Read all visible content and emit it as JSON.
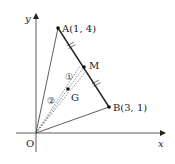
{
  "diagram": {
    "type": "coordinate-geometry",
    "axes": {
      "x_label": "x",
      "y_label": "y",
      "origin_label": "O"
    },
    "points": {
      "A": {
        "label": "A(1,  4)",
        "coords": [
          1,
          4
        ]
      },
      "B": {
        "label": "B(3,  1)",
        "coords": [
          3,
          1
        ]
      },
      "M": {
        "label": "M",
        "description": "midpoint of AB"
      },
      "G": {
        "label": "G",
        "description": "centroid of triangle OAB"
      }
    },
    "segment_labels": {
      "GM": "①",
      "OG": "②"
    },
    "colors": {
      "stroke": "#222222",
      "dashed": "#555555",
      "background": "#ffffff"
    }
  }
}
